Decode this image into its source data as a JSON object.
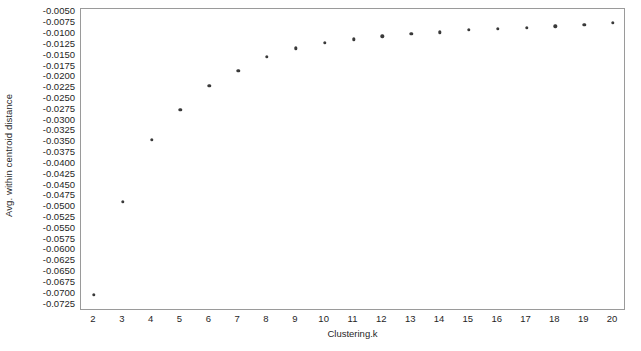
{
  "chart_data": {
    "type": "scatter",
    "title": "",
    "xlabel": "Clustering.k",
    "ylabel": "Avg. within centroid distance",
    "grid": false,
    "legend": null,
    "xlim": [
      1.55,
      20.45
    ],
    "ylim": [
      -0.074,
      -0.0042
    ],
    "x": [
      2,
      3,
      4,
      5,
      6,
      7,
      8,
      9,
      10,
      11,
      12,
      13,
      14,
      15,
      16,
      17,
      18,
      19,
      20
    ],
    "values": [
      -0.0703,
      -0.0488,
      -0.0345,
      -0.0275,
      -0.0219,
      -0.0185,
      -0.0152,
      -0.0133,
      -0.012,
      -0.0112,
      -0.0105,
      -0.01,
      -0.0096,
      -0.009,
      -0.0088,
      -0.0086,
      -0.0082,
      -0.0079,
      -0.0074
    ],
    "xticks": [
      "2",
      "3",
      "4",
      "5",
      "6",
      "7",
      "8",
      "9",
      "10",
      "11",
      "12",
      "13",
      "14",
      "15",
      "16",
      "17",
      "18",
      "19",
      "20"
    ],
    "yticks": [
      "-0.0050",
      "-0.0075",
      "-0.0100",
      "-0.0125",
      "-0.0150",
      "-0.0175",
      "-0.0200",
      "-0.0225",
      "-0.0250",
      "-0.0275",
      "-0.0300",
      "-0.0325",
      "-0.0350",
      "-0.0375",
      "-0.0400",
      "-0.0425",
      "-0.0450",
      "-0.0475",
      "-0.0500",
      "-0.0525",
      "-0.0550",
      "-0.0575",
      "-0.0600",
      "-0.0625",
      "-0.0650",
      "-0.0675",
      "-0.0700",
      "-0.0725"
    ],
    "ytick_values": [
      -0.005,
      -0.0075,
      -0.01,
      -0.0125,
      -0.015,
      -0.0175,
      -0.02,
      -0.0225,
      -0.025,
      -0.0275,
      -0.03,
      -0.0325,
      -0.035,
      -0.0375,
      -0.04,
      -0.0425,
      -0.045,
      -0.0475,
      -0.05,
      -0.0525,
      -0.055,
      -0.0575,
      -0.06,
      -0.0625,
      -0.065,
      -0.0675,
      -0.07,
      -0.0725
    ],
    "marker_color": "#3a3a3a",
    "frame_color": "#9a9a9a",
    "background_color": "#ffffff"
  }
}
